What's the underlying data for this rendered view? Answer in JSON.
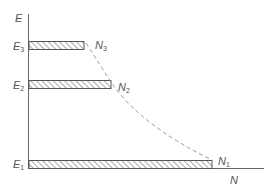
{
  "diagram": {
    "axes": {
      "y_label": "E",
      "x_label": "N"
    },
    "levels": [
      {
        "name": "E3",
        "label_main": "E",
        "label_sub": "3",
        "pop_main": "N",
        "pop_sub": "3"
      },
      {
        "name": "E2",
        "label_main": "E",
        "label_sub": "2",
        "pop_main": "N",
        "pop_sub": "2"
      },
      {
        "name": "E1",
        "label_main": "E",
        "label_sub": "1",
        "pop_main": "N",
        "pop_sub": "1"
      }
    ],
    "curve_style": "dashed",
    "colors": {
      "line": "#666666",
      "hatch": "#555555",
      "text": "#555555",
      "curve": "#999999"
    }
  }
}
